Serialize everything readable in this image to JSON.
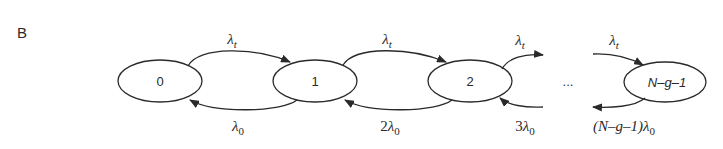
{
  "panel_label": "B",
  "diagram": {
    "type": "birth-death chain",
    "nodes": [
      {
        "id": "0",
        "label": "0"
      },
      {
        "id": "1",
        "label": "1"
      },
      {
        "id": "2",
        "label": "2"
      },
      {
        "id": "ellipsis",
        "label": "..."
      },
      {
        "id": "N-g-1",
        "label": "N–g–1"
      }
    ],
    "forward_rates": [
      {
        "from": "0",
        "to": "1",
        "symbol": "λ",
        "sub": "t",
        "prefix": ""
      },
      {
        "from": "1",
        "to": "2",
        "symbol": "λ",
        "sub": "t",
        "prefix": ""
      },
      {
        "from": "2",
        "to": "...",
        "symbol": "λ",
        "sub": "t",
        "prefix": ""
      },
      {
        "from": "...",
        "to": "N-g-1",
        "symbol": "λ",
        "sub": "t",
        "prefix": ""
      }
    ],
    "backward_rates": [
      {
        "from": "1",
        "to": "0",
        "symbol": "λ",
        "sub": "0",
        "prefix": ""
      },
      {
        "from": "2",
        "to": "1",
        "symbol": "λ",
        "sub": "0",
        "prefix": "2"
      },
      {
        "from": "...",
        "to": "2",
        "symbol": "λ",
        "sub": "0",
        "prefix": "3"
      },
      {
        "from": "N-g-1",
        "to": "...",
        "symbol": "λ",
        "sub": "0",
        "prefix": "(N–g–1)"
      }
    ]
  },
  "colors": {
    "stroke": "#2a2a2a",
    "background": "#ffffff"
  }
}
